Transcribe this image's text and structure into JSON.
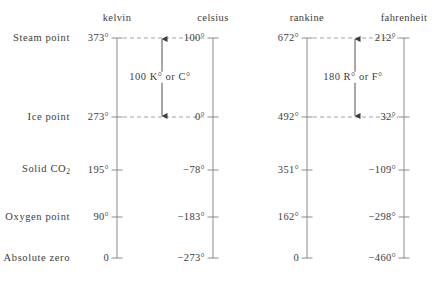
{
  "figure": {
    "kind": "temperature-scale-comparison",
    "line_color": "#8a8a8a",
    "dash_color": "#9a9a9a",
    "text_color": "#3c3c3c"
  },
  "scales": [
    {
      "key": "kelvin",
      "header": "kelvin",
      "axis_x": 117
    },
    {
      "key": "celsius",
      "header": "celsius",
      "axis_x": 213
    },
    {
      "key": "rankine",
      "header": "rankine",
      "axis_x": 307
    },
    {
      "key": "fahrenheit",
      "header": "fahrenheit",
      "axis_x": 404
    }
  ],
  "rows": [
    {
      "name": "Steam point",
      "y": 38,
      "kelvin": "373°",
      "celsius": "100°",
      "rankine": "672°",
      "fahrenheit": "212°"
    },
    {
      "name": "Ice point",
      "y": 117,
      "kelvin": "273°",
      "celsius": "0°",
      "rankine": "492°",
      "fahrenheit": "32°"
    },
    {
      "name": "Solid CO₂",
      "name_base": "Solid CO",
      "name_sub": "2",
      "y": 170,
      "kelvin": "195°",
      "celsius": "−78°",
      "rankine": "351°",
      "fahrenheit": "−109°"
    },
    {
      "name": "Oxygen point",
      "y": 217,
      "kelvin": "90°",
      "celsius": "−183°",
      "rankine": "162°",
      "fahrenheit": "−298°"
    },
    {
      "name": "Absolute zero",
      "y": 258,
      "kelvin": "0",
      "celsius": "−273°",
      "rankine": "0",
      "fahrenheit": "−460°"
    }
  ],
  "annotations": [
    {
      "key": "metric-interval",
      "label": "100 K° or C°",
      "arrow_x": 162,
      "top_y": 38,
      "bottom_y": 117,
      "label_x": 160,
      "label_y": 77
    },
    {
      "key": "imperial-interval",
      "label": "180 R° or F°",
      "arrow_x": 355,
      "top_y": 38,
      "bottom_y": 117,
      "label_x": 353,
      "label_y": 77
    }
  ]
}
